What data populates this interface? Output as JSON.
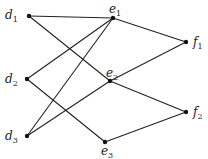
{
  "nodes": [
    {
      "id": "d1",
      "name": "d",
      "sub": "1",
      "x": 29,
      "y": 16,
      "lx": 5,
      "ly": 9
    },
    {
      "id": "d2",
      "name": "d",
      "sub": "2",
      "x": 27,
      "y": 79,
      "lx": 5,
      "ly": 73
    },
    {
      "id": "d3",
      "name": "d",
      "sub": "3",
      "x": 27,
      "y": 136,
      "lx": 5,
      "ly": 130
    },
    {
      "id": "e1",
      "name": "e",
      "sub": "1",
      "x": 113,
      "y": 18,
      "lx": 109,
      "ly": 3
    },
    {
      "id": "e2",
      "name": "e",
      "sub": "2",
      "x": 110,
      "y": 81,
      "lx": 106,
      "ly": 67
    },
    {
      "id": "e3",
      "name": "e",
      "sub": "3",
      "x": 105,
      "y": 142,
      "lx": 101,
      "ly": 145
    },
    {
      "id": "f1",
      "name": "f",
      "sub": "1",
      "x": 186,
      "y": 42,
      "lx": 193,
      "ly": 36
    },
    {
      "id": "f2",
      "name": "f",
      "sub": "2",
      "x": 186,
      "y": 112,
      "lx": 193,
      "ly": 106
    }
  ],
  "edges": [
    [
      "d1",
      "e1"
    ],
    [
      "d1",
      "e2"
    ],
    [
      "d2",
      "e1"
    ],
    [
      "d2",
      "e3"
    ],
    [
      "d3",
      "e1"
    ],
    [
      "d3",
      "e2"
    ],
    [
      "e1",
      "f1"
    ],
    [
      "e2",
      "f1"
    ],
    [
      "e2",
      "f2"
    ],
    [
      "e3",
      "f2"
    ]
  ],
  "style": {
    "stroke": "#222222",
    "node": "#111111"
  }
}
